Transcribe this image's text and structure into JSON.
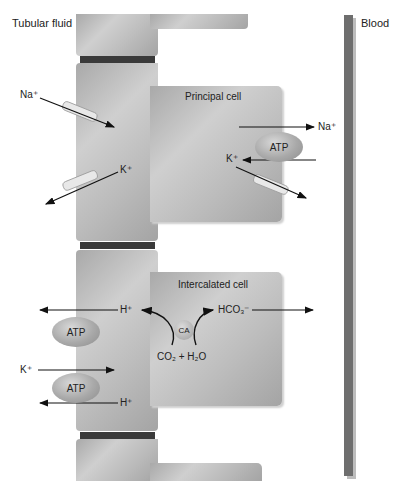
{
  "labels": {
    "tubular_fluid": "Tubular fluid",
    "blood": "Blood",
    "principal_cell": "Principal cell",
    "intercalated_cell": "Intercalated cell"
  },
  "principal": {
    "na_in": "Na⁺",
    "k_out": "K⁺",
    "na_basolateral": "Na⁺",
    "k_basolateral": "K⁺",
    "atp": "ATP"
  },
  "intercalated": {
    "h_apical": "H⁺",
    "hco3": "HCO₃⁻",
    "ca": "CA",
    "reaction": "CO₂ + H₂O",
    "k_in": "K⁺",
    "h_out": "H⁺",
    "atp_top": "ATP",
    "atp_bottom": "ATP"
  },
  "colors": {
    "cell": "#bdbdbd",
    "junction": "#3a3a3a",
    "blood_vessel": "#6e6e6e",
    "arrow": "#111111"
  }
}
